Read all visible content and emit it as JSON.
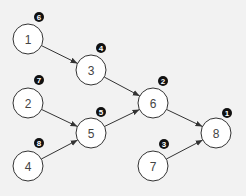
{
  "diagram": {
    "type": "directed-graph",
    "nodes": [
      {
        "id": "1",
        "label": "1",
        "x": 28,
        "y": 39,
        "order": "6",
        "bx": 39,
        "by": 17
      },
      {
        "id": "2",
        "label": "2",
        "x": 28,
        "y": 103,
        "order": "7",
        "bx": 39,
        "by": 80
      },
      {
        "id": "3",
        "label": "3",
        "x": 91,
        "y": 70,
        "order": "4",
        "bx": 101,
        "by": 48
      },
      {
        "id": "4",
        "label": "4",
        "x": 28,
        "y": 166,
        "order": "8",
        "bx": 39,
        "by": 143
      },
      {
        "id": "5",
        "label": "5",
        "x": 91,
        "y": 133,
        "order": "5",
        "bx": 101,
        "by": 112
      },
      {
        "id": "6",
        "label": "6",
        "x": 153,
        "y": 103,
        "order": "2",
        "bx": 163,
        "by": 81
      },
      {
        "id": "7",
        "label": "7",
        "x": 153,
        "y": 166,
        "order": "3",
        "bx": 164,
        "by": 144
      },
      {
        "id": "8",
        "label": "8",
        "x": 216,
        "y": 133,
        "order": "1",
        "bx": 227,
        "by": 113
      }
    ],
    "edges": [
      {
        "from": "1",
        "to": "3"
      },
      {
        "from": "3",
        "to": "6"
      },
      {
        "from": "2",
        "to": "5"
      },
      {
        "from": "4",
        "to": "5"
      },
      {
        "from": "5",
        "to": "6"
      },
      {
        "from": "6",
        "to": "8"
      },
      {
        "from": "7",
        "to": "8"
      }
    ],
    "node_radius": 15,
    "badge_radius": 5
  }
}
